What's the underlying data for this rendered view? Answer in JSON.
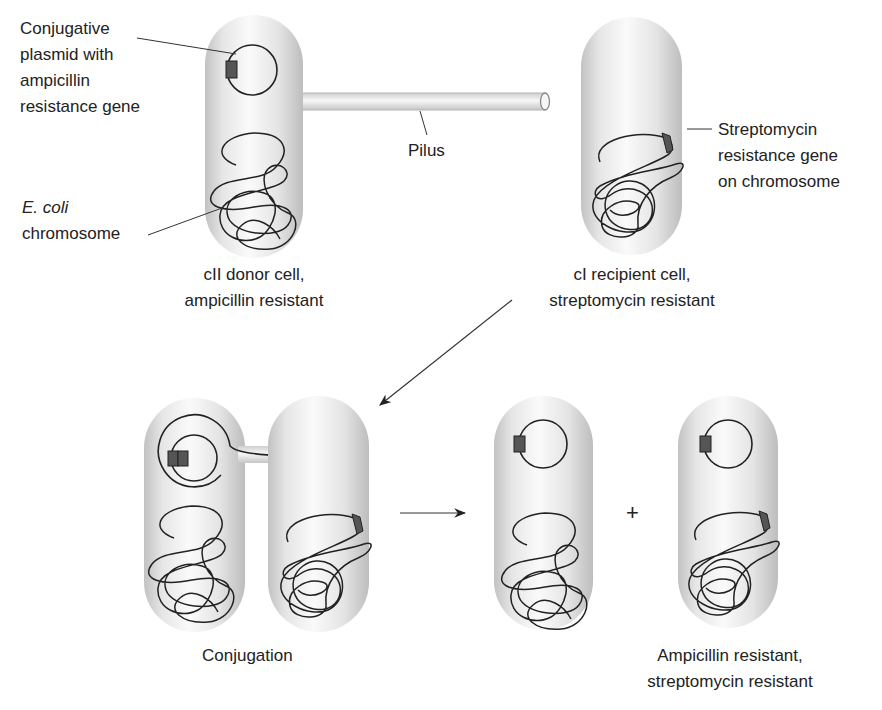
{
  "figure": {
    "colors": {
      "cell_edge": "#c4c4c4",
      "cell_center": "#fbfbfb",
      "gene_fill": "#555555",
      "line": "#222222"
    }
  },
  "top": {
    "donor": {
      "plasmid_label_lines": [
        "Conjugative",
        "plasmid with",
        "ampicillin",
        "resistance gene"
      ],
      "chromosome_label_italic": "E. coli",
      "chromosome_label": "chromosome",
      "caption_lines": [
        "cII donor cell,",
        "ampicillin resistant"
      ]
    },
    "pilus_label": "Pilus",
    "recipient": {
      "gene_label_lines": [
        "Streptomycin",
        "resistance gene",
        "on chromosome"
      ],
      "caption_lines": [
        "cI recipient cell,",
        "streptomycin resistant"
      ]
    }
  },
  "bottom": {
    "conjugation_label": "Conjugation",
    "plus": "+",
    "result_caption_lines": [
      "Ampicillin resistant,",
      "streptomycin resistant"
    ]
  }
}
